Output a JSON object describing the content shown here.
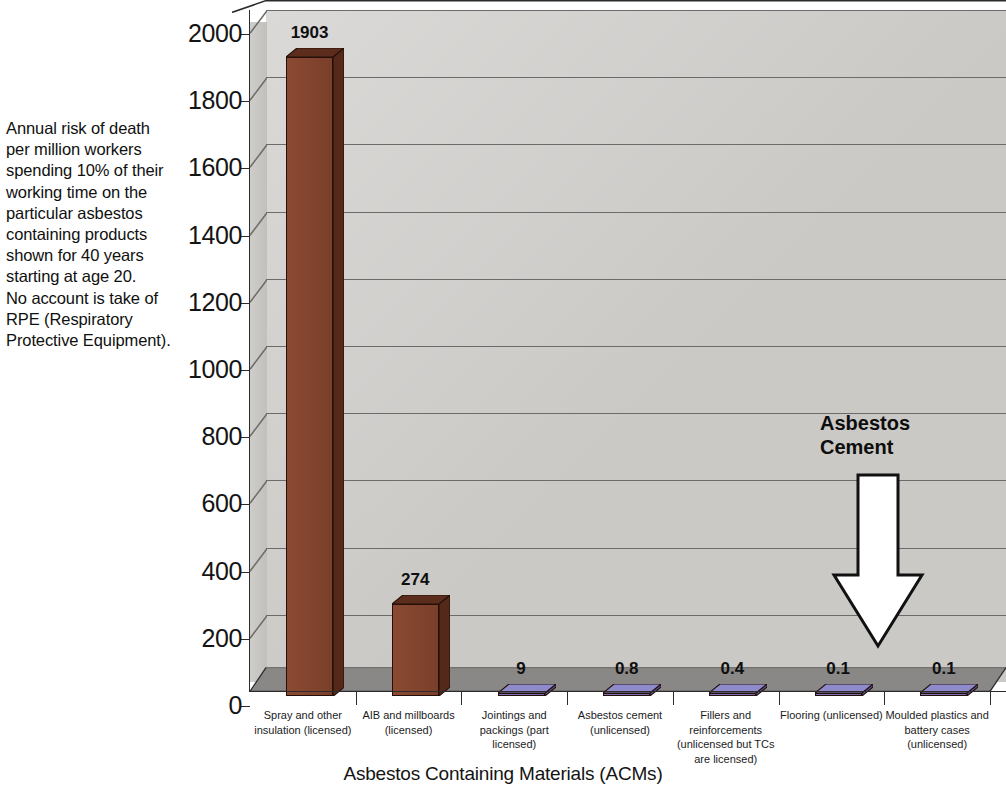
{
  "note": {
    "text": "Annual risk of death\nper million workers\nspending 10% of their\nworking time on the\nparticular asbestos\ncontaining products\nshown for 40 years\nstarting at age 20.\nNo account is take of\nRPE (Respiratory\nProtective Equipment)."
  },
  "callout": {
    "label": "Asbestos\nCement",
    "arrow_icon": "down-arrow-icon"
  },
  "axis": {
    "x_title": "Asbestos Containing Materials (ACMs)"
  },
  "chart_data": {
    "type": "bar",
    "title": "",
    "subtitle": "",
    "xlabel": "Asbestos Containing Materials (ACMs)",
    "ylabel": "",
    "ylim": [
      0,
      2000
    ],
    "ytick_values": [
      0,
      200,
      400,
      600,
      800,
      1000,
      1200,
      1400,
      1600,
      1800,
      2000
    ],
    "ytick_labels": [
      "0",
      "200",
      "400",
      "600",
      "800",
      "1000",
      "1200",
      "1400",
      "1600",
      "1800",
      "2000"
    ],
    "grid": true,
    "legend": false,
    "three_d": true,
    "categories": [
      "Spray and other\ninsulation (licensed)",
      "AIB and millboards\n(licensed)",
      "Jointings and\npackings (part\nlicensed)",
      "Asbestos cement\n(unlicensed)",
      "Fillers and\nreinforcements\n(unlicensed but TCs\nare licensed)",
      "Flooring (unlicensed)",
      "Moulded plastics and\nbattery cases\n(unlicensed)"
    ],
    "values": [
      1903,
      274,
      9,
      0.8,
      0.4,
      0.1,
      0.1
    ],
    "value_labels": [
      "1903",
      "274",
      "9",
      "0.8",
      "0.4",
      "0.1",
      "0.1"
    ],
    "bar_colors": [
      "#8B4A32",
      "#8B4A32",
      "#7B75B8",
      "#7B75B8",
      "#7B75B8",
      "#7B75B8",
      "#7B75B8"
    ],
    "annotations": [
      {
        "text": "Asbestos Cement",
        "points_to": "Asbestos cement (unlicensed)",
        "style": "down-arrow"
      }
    ]
  },
  "colors": {
    "back_wall": "#d2d0cd",
    "floor": "#8a8886",
    "brown_front": "#8B4A32",
    "brown_top": "#5C2D1C",
    "brown_side": "#55291A",
    "purple_front": "#7B75B8",
    "purple_top": "#8F8ACB",
    "gridline": "#6d6b69",
    "axis": "#2b2b2b"
  }
}
